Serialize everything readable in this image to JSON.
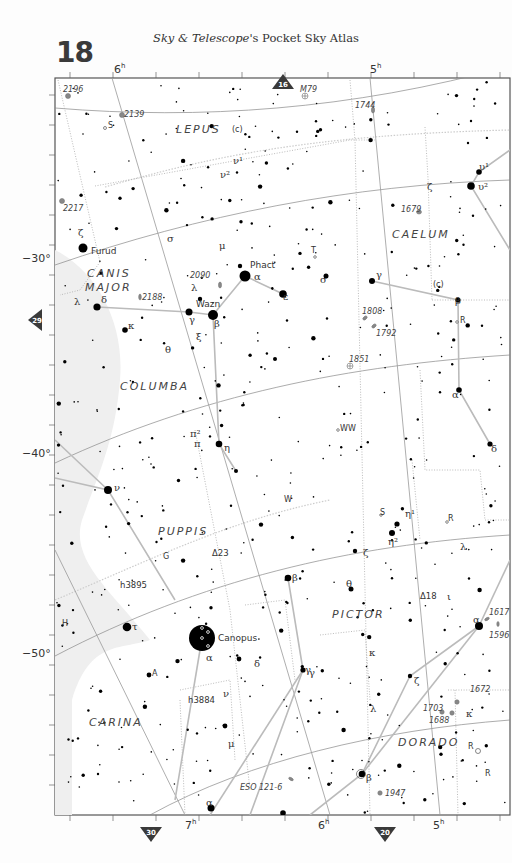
{
  "header": {
    "page_number": "18",
    "title_italic": "Sky & Telescope",
    "title_rest": "'s Pocket Sky Atlas"
  },
  "nav_arrows": {
    "top": {
      "label": "16",
      "x": 283,
      "y": 82
    },
    "left": {
      "label": "29",
      "x": 34,
      "y": 320
    },
    "bottom_left": {
      "label": "30",
      "x": 151,
      "y": 835
    },
    "bottom_right": {
      "label": "20",
      "x": 385,
      "y": 835
    }
  },
  "axes": {
    "ra_top": [
      {
        "label": "6",
        "sup": "h",
        "x": 114,
        "y": 73
      },
      {
        "label": "5",
        "sup": "h",
        "x": 370,
        "y": 73
      }
    ],
    "ra_bottom": [
      {
        "label": "7",
        "sup": "h",
        "x": 185,
        "y": 829
      },
      {
        "label": "6",
        "sup": "h",
        "x": 318,
        "y": 829
      },
      {
        "label": "5",
        "sup": "h",
        "x": 433,
        "y": 829
      }
    ],
    "dec_left": [
      {
        "label": "−30°",
        "y": 262
      },
      {
        "label": "−40°",
        "y": 457
      },
      {
        "label": "−50°",
        "y": 657
      }
    ]
  },
  "colors": {
    "frame": "#555555",
    "star": "#000000",
    "const_line": "#bbbbbb",
    "boundary": "#aaaaaa",
    "grid": "#888888",
    "milky_way": "#f0f0f0",
    "nav_arrow": "#3a3a3a"
  },
  "constellations": [
    {
      "name": "LEPUS",
      "x": 176,
      "y": 133
    },
    {
      "name": "CAELUM",
      "x": 392,
      "y": 238
    },
    {
      "name": "CANIS",
      "x": 87,
      "y": 277
    },
    {
      "name": "MAJOR",
      "x": 85,
      "y": 291
    },
    {
      "name": "COLUMBA",
      "x": 120,
      "y": 390
    },
    {
      "name": "PUPPIS",
      "x": 158,
      "y": 535
    },
    {
      "name": "PICTOR",
      "x": 332,
      "y": 618
    },
    {
      "name": "CARINA",
      "x": 89,
      "y": 726
    },
    {
      "name": "DORADO",
      "x": 398,
      "y": 746
    }
  ],
  "named_stars": [
    {
      "name": "Furud",
      "x": 91,
      "y": 254
    },
    {
      "name": "Phact",
      "x": 250,
      "y": 268
    },
    {
      "name": "Wazn",
      "x": 196,
      "y": 307
    },
    {
      "name": "Canopus",
      "x": 218,
      "y": 641
    }
  ],
  "greek_labels": [
    {
      "t": "ζ",
      "x": 78,
      "y": 236
    },
    {
      "t": "σ",
      "x": 167,
      "y": 242
    },
    {
      "t": "μ",
      "x": 219,
      "y": 249
    },
    {
      "t": "λ",
      "x": 191,
      "y": 291
    },
    {
      "t": "α",
      "x": 254,
      "y": 280
    },
    {
      "t": "ε",
      "x": 283,
      "y": 300
    },
    {
      "t": "γ",
      "x": 189,
      "y": 323
    },
    {
      "t": "β",
      "x": 214,
      "y": 327
    },
    {
      "t": "ξ",
      "x": 196,
      "y": 340
    },
    {
      "t": "λ",
      "x": 74,
      "y": 305
    },
    {
      "t": "δ",
      "x": 101,
      "y": 303
    },
    {
      "t": "κ",
      "x": 128,
      "y": 329
    },
    {
      "t": "θ",
      "x": 165,
      "y": 353
    },
    {
      "t": "σ",
      "x": 320,
      "y": 283
    },
    {
      "t": "γ",
      "x": 376,
      "y": 278
    },
    {
      "t": "β",
      "x": 455,
      "y": 304
    },
    {
      "t": "ζ",
      "x": 427,
      "y": 190
    },
    {
      "t": "υ¹",
      "x": 479,
      "y": 170
    },
    {
      "t": "υ²",
      "x": 478,
      "y": 190
    },
    {
      "t": "ν¹",
      "x": 233,
      "y": 164
    },
    {
      "t": "ν²",
      "x": 220,
      "y": 178
    },
    {
      "t": "π²",
      "x": 190,
      "y": 437
    },
    {
      "t": "π",
      "x": 194,
      "y": 447
    },
    {
      "t": "η",
      "x": 224,
      "y": 451
    },
    {
      "t": "α",
      "x": 452,
      "y": 398
    },
    {
      "t": "δ",
      "x": 491,
      "y": 452
    },
    {
      "t": "ν",
      "x": 114,
      "y": 491
    },
    {
      "t": "η¹",
      "x": 405,
      "y": 517
    },
    {
      "t": "η²",
      "x": 388,
      "y": 545
    },
    {
      "t": "λ",
      "x": 460,
      "y": 550
    },
    {
      "t": "ζ",
      "x": 363,
      "y": 556
    },
    {
      "t": "θ",
      "x": 346,
      "y": 587
    },
    {
      "t": "ι",
      "x": 447,
      "y": 600
    },
    {
      "t": "β",
      "x": 292,
      "y": 581
    },
    {
      "t": "τ",
      "x": 132,
      "y": 630
    },
    {
      "t": "α",
      "x": 206,
      "y": 661
    },
    {
      "t": "δ",
      "x": 254,
      "y": 667
    },
    {
      "t": "α",
      "x": 473,
      "y": 623
    },
    {
      "t": "κ",
      "x": 369,
      "y": 656
    },
    {
      "t": "γ",
      "x": 309,
      "y": 676
    },
    {
      "t": "ζ",
      "x": 414,
      "y": 684
    },
    {
      "t": "λ",
      "x": 370,
      "y": 712
    },
    {
      "t": "κ",
      "x": 466,
      "y": 717
    },
    {
      "t": "ν",
      "x": 223,
      "y": 697
    },
    {
      "t": "μ",
      "x": 228,
      "y": 747
    },
    {
      "t": "β",
      "x": 366,
      "y": 781
    },
    {
      "t": "α",
      "x": 206,
      "y": 806
    },
    {
      "t": "γ",
      "x": 305,
      "y": 673
    }
  ],
  "variable_labels": [
    {
      "t": "S",
      "x": 108,
      "y": 128
    },
    {
      "t": "(c)",
      "x": 232,
      "y": 132
    },
    {
      "t": "T",
      "x": 311,
      "y": 253
    },
    {
      "t": "(c)",
      "x": 433,
      "y": 287
    },
    {
      "t": "R",
      "x": 460,
      "y": 323
    },
    {
      "t": "WW",
      "x": 340,
      "y": 431
    },
    {
      "t": "W",
      "x": 284,
      "y": 502
    },
    {
      "t": "S",
      "x": 380,
      "y": 515
    },
    {
      "t": "R",
      "x": 448,
      "y": 521
    },
    {
      "t": "G",
      "x": 163,
      "y": 559
    },
    {
      "t": "H",
      "x": 62,
      "y": 626
    },
    {
      "t": "A",
      "x": 152,
      "y": 676
    },
    {
      "t": "R",
      "x": 468,
      "y": 749
    },
    {
      "t": "R",
      "x": 485,
      "y": 776
    }
  ],
  "dso_labels": [
    {
      "t": "2196",
      "x": 63,
      "y": 92
    },
    {
      "t": "2139",
      "x": 124,
      "y": 117
    },
    {
      "t": "M79",
      "x": 300,
      "y": 92
    },
    {
      "t": "1744",
      "x": 355,
      "y": 108
    },
    {
      "t": "2217",
      "x": 63,
      "y": 211
    },
    {
      "t": "1679",
      "x": 401,
      "y": 212
    },
    {
      "t": "2090",
      "x": 190,
      "y": 278
    },
    {
      "t": "2188",
      "x": 142,
      "y": 300
    },
    {
      "t": "1808",
      "x": 362,
      "y": 314
    },
    {
      "t": "1792",
      "x": 376,
      "y": 336
    },
    {
      "t": "1851",
      "x": 349,
      "y": 362
    },
    {
      "t": "1617",
      "x": 489,
      "y": 615
    },
    {
      "t": "1596",
      "x": 489,
      "y": 638
    },
    {
      "t": "1672",
      "x": 470,
      "y": 692
    },
    {
      "t": "1703",
      "x": 423,
      "y": 711
    },
    {
      "t": "1688",
      "x": 429,
      "y": 723
    },
    {
      "t": "1947",
      "x": 385,
      "y": 796
    },
    {
      "t": "ESO 121-6",
      "x": 240,
      "y": 790
    }
  ],
  "double_star_labels": [
    {
      "t": "h3895",
      "x": 120,
      "y": 588
    },
    {
      "t": "Δ23",
      "x": 212,
      "y": 556
    },
    {
      "t": "Δ18",
      "x": 420,
      "y": 599
    },
    {
      "t": "h3884",
      "x": 188,
      "y": 703
    }
  ],
  "bright_stars": [
    {
      "x": 83,
      "y": 248,
      "r": 4.5
    },
    {
      "x": 245,
      "y": 276,
      "r": 5.5
    },
    {
      "x": 213,
      "y": 315,
      "r": 5
    },
    {
      "x": 189,
      "y": 312,
      "r": 3.5
    },
    {
      "x": 283,
      "y": 294,
      "r": 3.8
    },
    {
      "x": 97,
      "y": 307,
      "r": 3.6
    },
    {
      "x": 125,
      "y": 330,
      "r": 2.8
    },
    {
      "x": 372,
      "y": 281,
      "r": 3
    },
    {
      "x": 458,
      "y": 300,
      "r": 2.6
    },
    {
      "x": 479,
      "y": 172,
      "r": 2.8
    },
    {
      "x": 471,
      "y": 186,
      "r": 3.8
    },
    {
      "x": 219,
      "y": 444,
      "r": 3.3
    },
    {
      "x": 459,
      "y": 390,
      "r": 2.8
    },
    {
      "x": 490,
      "y": 444,
      "r": 2.6
    },
    {
      "x": 108,
      "y": 490,
      "r": 4
    },
    {
      "x": 288,
      "y": 578,
      "r": 3.3
    },
    {
      "x": 127,
      "y": 627,
      "r": 4.3
    },
    {
      "x": 202,
      "y": 638,
      "r": 13
    },
    {
      "x": 479,
      "y": 626,
      "r": 4
    },
    {
      "x": 303,
      "y": 670,
      "r": 2.6
    },
    {
      "x": 410,
      "y": 676,
      "r": 2.2
    },
    {
      "x": 362,
      "y": 774,
      "r": 3.3
    },
    {
      "x": 211,
      "y": 808,
      "r": 3.5
    },
    {
      "x": 397,
      "y": 524,
      "r": 2.6
    },
    {
      "x": 392,
      "y": 533,
      "r": 3
    },
    {
      "x": 239,
      "y": 659,
      "r": 2.4
    },
    {
      "x": 149,
      "y": 675,
      "r": 2.4
    },
    {
      "x": 240,
      "y": 266,
      "r": 2.2
    },
    {
      "x": 200,
      "y": 299,
      "r": 2.2
    },
    {
      "x": 326,
      "y": 276,
      "r": 2.5
    },
    {
      "x": 355,
      "y": 551,
      "r": 2.2
    },
    {
      "x": 351,
      "y": 589,
      "r": 2.5
    },
    {
      "x": 275,
      "y": 359,
      "r": 2
    },
    {
      "x": 236,
      "y": 471,
      "r": 2
    },
    {
      "x": 225,
      "y": 726,
      "r": 2.4
    },
    {
      "x": 283,
      "y": 813,
      "r": 2.8
    }
  ]
}
